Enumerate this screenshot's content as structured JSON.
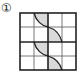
{
  "figure": {
    "label": "①",
    "grid": {
      "rows": 4,
      "cols": 4
    },
    "colors": {
      "line": "#333333",
      "fill": "#d9d9d9",
      "background": "#ffffff"
    }
  }
}
